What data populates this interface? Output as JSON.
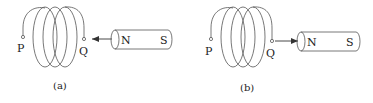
{
  "panels": [
    {
      "id": "a",
      "caption": "(a)",
      "coil_terminals": {
        "left": "P",
        "right": "Q"
      },
      "magnet": {
        "near_pole": "N",
        "far_pole": "S"
      },
      "arrow_direction": "toward coil (magnet moving toward Q)"
    },
    {
      "id": "b",
      "caption": "(b)",
      "coil_terminals": {
        "left": "P",
        "right": "Q"
      },
      "magnet": {
        "near_pole": "N",
        "far_pole": "S"
      },
      "arrow_direction": "away from coil (magnet moving away from Q)"
    }
  ],
  "colors": {
    "stroke": "#555555",
    "text": "#222222"
  }
}
